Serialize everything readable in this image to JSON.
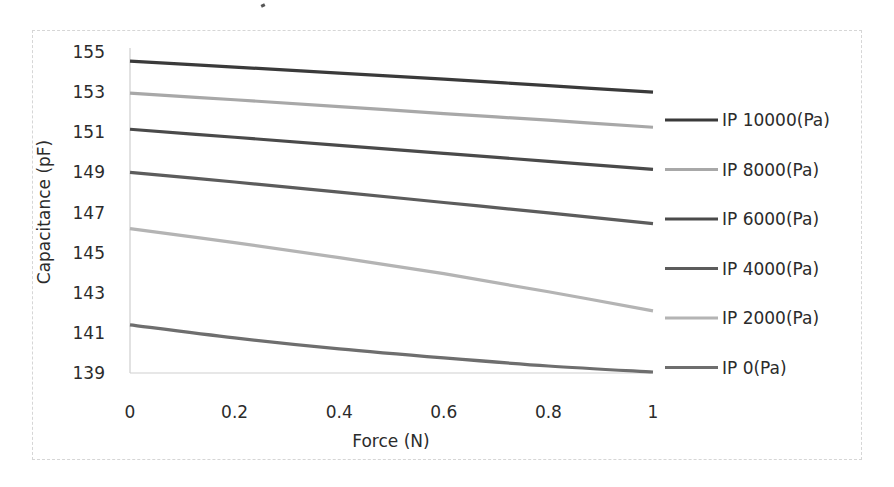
{
  "chart_data": {
    "type": "line",
    "title": "",
    "xlabel": "Force (N)",
    "ylabel": "Capacitance (pF)",
    "xlim": [
      0,
      1
    ],
    "ylim": [
      139,
      155
    ],
    "x_ticks": [
      "0",
      "0.2",
      "0.4",
      "0.6",
      "0.8",
      "1"
    ],
    "y_ticks": [
      "139",
      "141",
      "143",
      "145",
      "147",
      "149",
      "151",
      "153",
      "155"
    ],
    "grid": false,
    "legend_position": "right",
    "x": [
      0,
      0.2,
      0.4,
      0.6,
      0.8,
      1.0
    ],
    "series": [
      {
        "name": "IP 10000(Pa)",
        "color": "#3a3a3a",
        "values": [
          154.55,
          154.25,
          153.95,
          153.65,
          153.32,
          153.0
        ]
      },
      {
        "name": "IP 8000(Pa)",
        "color": "#a8a8a8",
        "values": [
          152.95,
          152.62,
          152.28,
          151.93,
          151.6,
          151.25
        ]
      },
      {
        "name": "IP 6000(Pa)",
        "color": "#4a4a4a",
        "values": [
          151.15,
          150.75,
          150.35,
          149.95,
          149.55,
          149.15
        ]
      },
      {
        "name": "IP 4000(Pa)",
        "color": "#5c5c5c",
        "values": [
          149.0,
          148.52,
          148.02,
          147.5,
          146.98,
          146.45
        ]
      },
      {
        "name": "IP 2000(Pa)",
        "color": "#b4b4b4",
        "values": [
          146.2,
          145.5,
          144.75,
          143.95,
          143.05,
          142.1
        ]
      },
      {
        "name": "IP 0(Pa)",
        "color": "#6e6e6e",
        "values": [
          141.4,
          140.75,
          140.2,
          139.75,
          139.35,
          139.05
        ]
      }
    ]
  }
}
